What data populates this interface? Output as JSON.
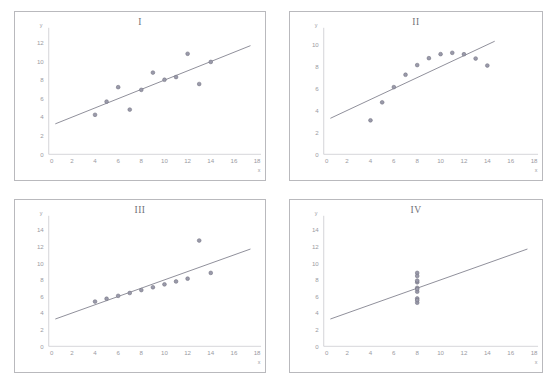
{
  "figure": {
    "clipped_header_text": "",
    "marker_color": "#9a9aaa",
    "marker_edge_color": "#70707f",
    "line_color": "#7b7b88",
    "axis_color": "#c2c2c8",
    "panel_border_color": "#b9b9bd",
    "background_color": "#ffffff"
  },
  "chart_data": [
    {
      "type": "scatter",
      "title": "I",
      "xlabel": "x",
      "ylabel": "y",
      "xlim": [
        0,
        18
      ],
      "ylim": [
        0,
        13
      ],
      "xticks": [
        0,
        2,
        4,
        6,
        8,
        10,
        12,
        14,
        16,
        18
      ],
      "yticks": [
        0,
        2,
        4,
        6,
        8,
        10,
        12
      ],
      "grid": false,
      "legend": "none",
      "x": [
        10,
        8,
        13,
        9,
        11,
        14,
        6,
        4,
        12,
        7,
        5
      ],
      "y": [
        8.04,
        6.95,
        7.58,
        8.81,
        8.33,
        9.96,
        7.24,
        4.26,
        10.84,
        4.82,
        5.68
      ],
      "fit_line": {
        "slope": 0.5,
        "intercept": 3.0,
        "x_from": 0.6,
        "x_to": 17.4
      }
    },
    {
      "type": "scatter",
      "title": "II",
      "xlabel": "x",
      "ylabel": "y",
      "xlim": [
        0,
        18
      ],
      "ylim": [
        0,
        11
      ],
      "xticks": [
        0,
        2,
        4,
        6,
        8,
        10,
        12,
        14,
        16,
        18
      ],
      "yticks": [
        0,
        2,
        4,
        6,
        8,
        10
      ],
      "grid": false,
      "legend": "none",
      "x": [
        10,
        8,
        13,
        9,
        11,
        14,
        6,
        4,
        12,
        7,
        5
      ],
      "y": [
        9.14,
        8.14,
        8.74,
        8.77,
        9.26,
        8.1,
        6.13,
        3.1,
        9.13,
        7.26,
        4.74
      ],
      "fit_line": {
        "slope": 0.5,
        "intercept": 3.0,
        "x_from": 0.6,
        "x_to": 14.6
      }
    },
    {
      "type": "scatter",
      "title": "III",
      "xlabel": "x",
      "ylabel": "y",
      "xlim": [
        0,
        18
      ],
      "ylim": [
        0,
        15
      ],
      "xticks": [
        0,
        2,
        4,
        6,
        8,
        10,
        12,
        14,
        16,
        18
      ],
      "yticks": [
        0,
        2,
        4,
        6,
        8,
        10,
        12,
        14
      ],
      "grid": false,
      "legend": "none",
      "x": [
        10,
        8,
        13,
        9,
        11,
        14,
        6,
        4,
        12,
        7,
        5
      ],
      "y": [
        7.46,
        6.77,
        12.74,
        7.11,
        7.81,
        8.84,
        6.08,
        5.39,
        8.15,
        6.42,
        5.73
      ],
      "fit_line": {
        "slope": 0.5,
        "intercept": 3.0,
        "x_from": 0.6,
        "x_to": 17.4
      }
    },
    {
      "type": "scatter",
      "title": "IV",
      "xlabel": "x",
      "ylabel": "y",
      "xlim": [
        0,
        18
      ],
      "ylim": [
        0,
        15
      ],
      "xticks": [
        0,
        2,
        4,
        6,
        8,
        10,
        12,
        14,
        16,
        18
      ],
      "yticks": [
        0,
        2,
        4,
        6,
        8,
        10,
        12,
        14
      ],
      "grid": false,
      "legend": "none",
      "x": [
        8,
        8,
        8,
        8,
        8,
        8,
        8,
        8,
        8,
        8,
        8
      ],
      "y": [
        6.58,
        5.76,
        7.71,
        8.84,
        8.47,
        7.04,
        5.25,
        5.56,
        7.91,
        6.89,
        12.5
      ],
      "y_visible": [
        6.58,
        5.76,
        7.71,
        8.84,
        8.47,
        7.04,
        5.25,
        5.56,
        7.91,
        6.89
      ],
      "fit_line": {
        "slope": 0.5,
        "intercept": 3.0,
        "x_from": 0.6,
        "x_to": 17.4
      }
    }
  ]
}
